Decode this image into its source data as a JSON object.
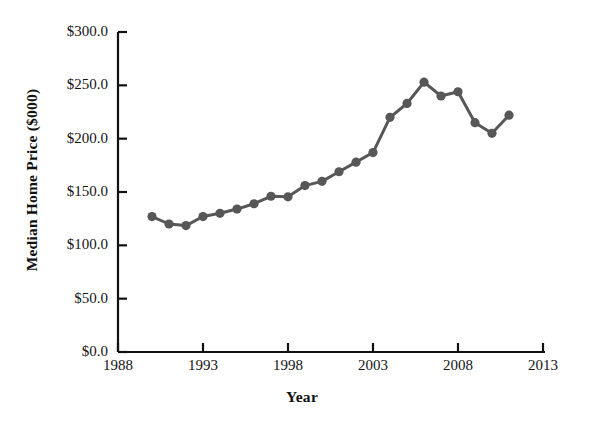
{
  "chart_data": {
    "type": "line",
    "title": "",
    "xlabel": "Year",
    "ylabel": "Median Home Price ($000)",
    "xlim": [
      1988,
      2013
    ],
    "ylim": [
      0,
      300
    ],
    "x_ticks": [
      1988,
      1993,
      1998,
      2003,
      2008,
      2013
    ],
    "x_tick_labels": [
      "1988",
      "1993",
      "1998",
      "2003",
      "2008",
      "2013"
    ],
    "y_ticks": [
      0,
      50,
      100,
      150,
      200,
      250,
      300
    ],
    "y_tick_labels": [
      "$0.0",
      "$50.0",
      "$100.0",
      "$150.0",
      "$200.0",
      "$250.0",
      "$300.0"
    ],
    "grid": false,
    "legend": false,
    "legend_position": "none",
    "marker": "circle",
    "series_color": "#575757",
    "axis_color": "#111111",
    "background_color": "#ffffff",
    "x": [
      1990,
      1991,
      1992,
      1993,
      1994,
      1995,
      1996,
      1997,
      1998,
      1999,
      2000,
      2001,
      2002,
      2003,
      2004,
      2005,
      2006,
      2007,
      2008,
      2009,
      2010,
      2011
    ],
    "values": [
      127.0,
      120.0,
      118.5,
      127.0,
      130.0,
      134.0,
      139.0,
      146.0,
      145.5,
      156.0,
      160.0,
      169.0,
      178.0,
      187.0,
      220.0,
      233.0,
      253.0,
      240.0,
      244.0,
      215.0,
      205.0,
      222.0
    ],
    "series": [
      {
        "name": "Median Home Price",
        "values": [
          127.0,
          120.0,
          118.5,
          127.0,
          130.0,
          134.0,
          139.0,
          146.0,
          145.5,
          156.0,
          160.0,
          169.0,
          178.0,
          187.0,
          220.0,
          233.0,
          253.0,
          240.0,
          244.0,
          215.0,
          205.0,
          222.0
        ]
      }
    ]
  }
}
